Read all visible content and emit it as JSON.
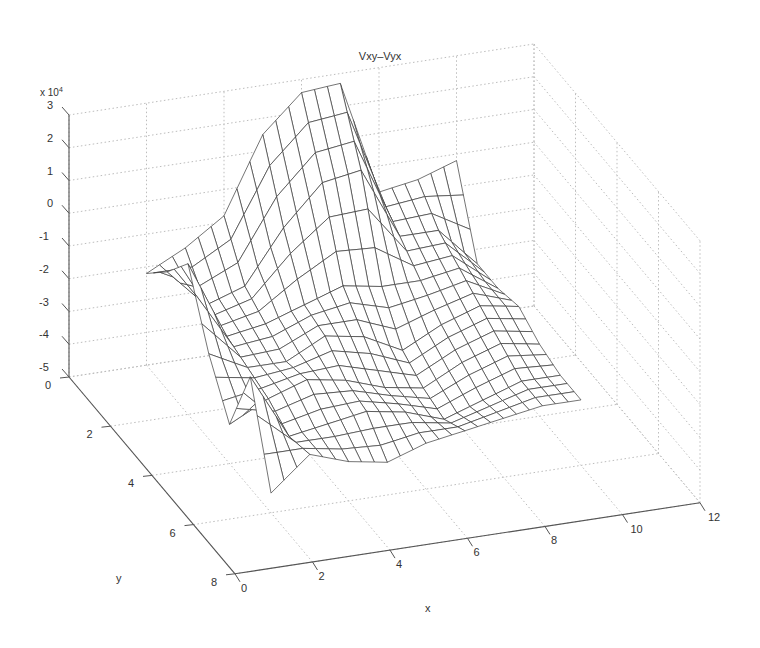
{
  "chart_data": {
    "type": "surface",
    "title": "Vxy–Vyx",
    "xlabel": "x",
    "ylabel": "y",
    "zlabel": "",
    "z_multiplier": "x 10^4",
    "xlim": [
      0,
      12
    ],
    "ylim": [
      0,
      8
    ],
    "zlim": [
      -50000,
      30000
    ],
    "x_ticks": [
      "0",
      "2",
      "4",
      "6",
      "8",
      "10",
      "12"
    ],
    "y_ticks": [
      "0",
      "2",
      "4",
      "6",
      "8"
    ],
    "z_ticks": [
      "3",
      "2",
      "1",
      "0",
      "-1",
      "-2",
      "-3",
      "-4",
      "-5"
    ],
    "grid": true,
    "surface_extent": {
      "x": [
        2,
        10
      ],
      "y": [
        0,
        6
      ]
    },
    "x": [
      2,
      3,
      4,
      5,
      6,
      7,
      8,
      9,
      10
    ],
    "y": [
      0,
      1,
      2,
      3,
      4,
      5,
      6
    ],
    "z_1e4": [
      [
        -2.2,
        -1.6,
        -0.8,
        1.5,
        2.6,
        2.7,
        -0.8,
        -0.6,
        -0.2
      ],
      [
        -1.4,
        -2.6,
        -2.2,
        -0.6,
        0.6,
        0.8,
        -1.4,
        -1.4,
        -2.6
      ],
      [
        -0.4,
        -2.8,
        -2.6,
        -2.2,
        -1.8,
        -2.0,
        -2.0,
        -1.8,
        -2.6
      ],
      [
        -2.4,
        -3.0,
        -3.0,
        -2.4,
        -2.6,
        -3.2,
        -2.6,
        -2.2,
        -2.4
      ],
      [
        -3.8,
        -3.2,
        -2.8,
        -3.0,
        -3.4,
        -3.6,
        -3.0,
        -2.6,
        -2.8
      ],
      [
        -1.6,
        -3.6,
        -3.4,
        -3.2,
        -3.4,
        -3.8,
        -3.4,
        -3.0,
        -3.0
      ],
      [
        -4.4,
        -3.4,
        -3.8,
        -4.0,
        -3.6,
        -3.4,
        -3.2,
        -3.0,
        -3.0
      ]
    ],
    "mesh_color": "#3a3a3a",
    "grid_color": "#bdbdbd"
  }
}
